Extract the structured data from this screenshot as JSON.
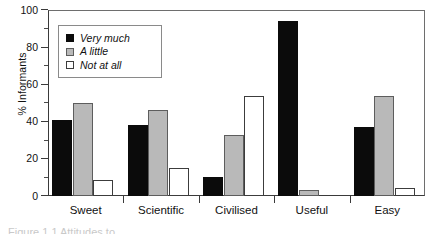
{
  "chart_data": {
    "type": "bar",
    "title": "",
    "xlabel": "",
    "ylabel": "% Informants",
    "ylim": [
      0,
      100
    ],
    "yticks": [
      0,
      20,
      40,
      60,
      80,
      100
    ],
    "ytick_labels": [
      "0",
      "20",
      "40",
      "60",
      "80",
      "100"
    ],
    "yminor_ticks": [
      10,
      30,
      50,
      70,
      90
    ],
    "grid": false,
    "legend_position": "upper-left-inside",
    "categories": [
      "Sweet",
      "Scientific",
      "Civilised",
      "Useful",
      "Easy"
    ],
    "series": [
      {
        "name": "Very much",
        "color": "#0b0b0b",
        "values": [
          41,
          38,
          10,
          94,
          37
        ]
      },
      {
        "name": "A little",
        "color": "#b9b9b9",
        "values": [
          50,
          46,
          33,
          3,
          54
        ]
      },
      {
        "name": "Not at all",
        "color": "#ffffff",
        "values": [
          8.5,
          15,
          54,
          0,
          4.5
        ]
      }
    ]
  },
  "legend": {
    "items": [
      {
        "label": "Very much"
      },
      {
        "label": "A little"
      },
      {
        "label": "Not at all"
      }
    ]
  },
  "caption": {
    "text": "Figure 1.1  Attitudes to"
  }
}
